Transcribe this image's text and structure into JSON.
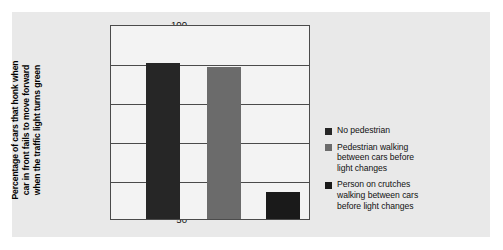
{
  "figure": {
    "panel_color": "#e9e9e9",
    "plot_background": "#f3f3f3",
    "axis_color": "#4b4b4b"
  },
  "chart_data": {
    "type": "bar",
    "title": "",
    "xlabel": "",
    "ylabel": "Percentage of cars that honk when car in front fails to move forward when the traffic light turns green",
    "ylabel_lines": [
      "Percentage of cars that honk when",
      "car in front fails to move forward",
      "when the traffic light turns green"
    ],
    "ylim": [
      50,
      100
    ],
    "yticks": [
      100,
      90,
      80,
      70,
      60,
      50
    ],
    "ytick_labels": [
      "100",
      "90",
      "80",
      "70",
      "60",
      "50"
    ],
    "grid": true,
    "legend_position": "right",
    "categories": [
      "No pedestrian",
      "Pedestrian walking between cars before light changes",
      "Person on crutches walking between cars before light changes"
    ],
    "values": [
      90,
      89,
      57
    ],
    "colors": [
      "#262626",
      "#6b6b6b",
      "#1a1a1a"
    ]
  },
  "legend": {
    "items": [
      {
        "color": "#262626",
        "lines": [
          "No pedestrian"
        ]
      },
      {
        "color": "#6b6b6b",
        "lines": [
          "Pedestrian walking",
          "between cars before",
          "light changes"
        ]
      },
      {
        "color": "#1a1a1a",
        "lines": [
          "Person on crutches",
          "walking between cars",
          "before light changes"
        ]
      }
    ]
  }
}
